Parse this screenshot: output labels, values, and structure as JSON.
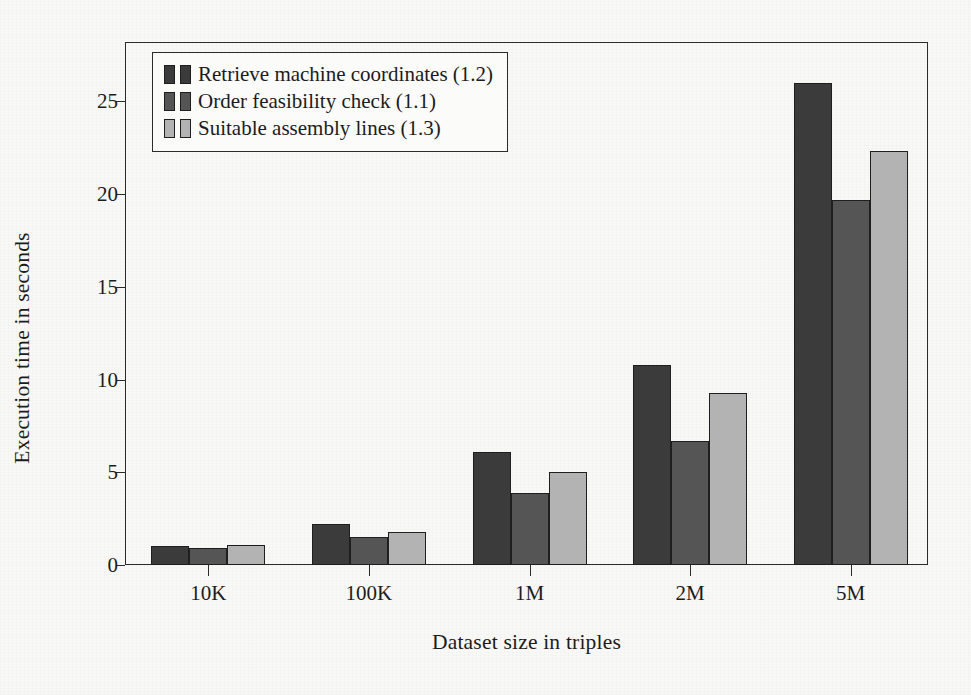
{
  "chart_data": {
    "type": "bar",
    "title": "",
    "xlabel": "Dataset size in triples",
    "ylabel": "Execution time in seconds",
    "categories": [
      "10K",
      "100K",
      "1M",
      "2M",
      "5M"
    ],
    "series": [
      {
        "name": "Retrieve machine coordinates (1.2)",
        "color": "#3b3b3b",
        "values": [
          1.0,
          2.2,
          6.1,
          10.8,
          26.0
        ]
      },
      {
        "name": "Order feasibility check (1.1)",
        "color": "#555555",
        "values": [
          0.9,
          1.5,
          3.9,
          6.7,
          19.7
        ]
      },
      {
        "name": "Suitable assembly lines (1.3)",
        "color": "#b3b3b3",
        "values": [
          1.1,
          1.8,
          5.0,
          9.3,
          22.3
        ]
      }
    ],
    "ylim": [
      0,
      28.2
    ],
    "yticks": [
      0,
      5,
      10,
      15,
      20,
      25
    ],
    "ytick_labels": [
      "0",
      "5",
      "10",
      "15",
      "20",
      "25"
    ],
    "grid": false,
    "legend_position": "top-left",
    "legend_entries": [
      "Retrieve machine coordinates (1.2)",
      "Order feasibility check (1.1)",
      "Suitable assembly lines (1.3)"
    ]
  }
}
